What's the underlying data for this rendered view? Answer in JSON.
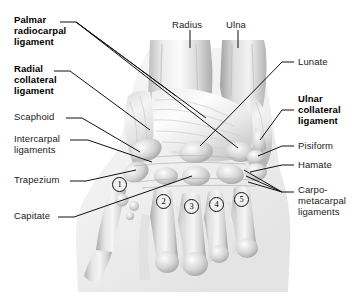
{
  "figure": {
    "type": "anatomical-illustration",
    "background_color": "#ffffff",
    "ink_color": "#1a1a1a",
    "width": 357,
    "height": 297
  },
  "labels_left": [
    {
      "id": "palmar-radiocarpal-ligament",
      "text": "Palmar\nradiocarpal\nligament",
      "bold": true,
      "x": 14,
      "y": 14
    },
    {
      "id": "radial-collateral-ligament",
      "text": "Radial\ncollateral\nligament",
      "bold": true,
      "x": 14,
      "y": 63
    },
    {
      "id": "scaphoid",
      "text": "Scaphoid",
      "bold": false,
      "x": 14,
      "y": 111
    },
    {
      "id": "intercarpal-ligaments",
      "text": "Intercarpal\nligaments",
      "bold": false,
      "x": 14,
      "y": 133
    },
    {
      "id": "trapezium",
      "text": "Trapezium",
      "bold": false,
      "x": 14,
      "y": 174
    },
    {
      "id": "capitate",
      "text": "Capitate",
      "bold": false,
      "x": 14,
      "y": 210
    }
  ],
  "labels_top": [
    {
      "id": "radius",
      "text": "Radius",
      "bold": false,
      "x": 172,
      "y": 19
    },
    {
      "id": "ulna",
      "text": "Ulna",
      "bold": false,
      "x": 226,
      "y": 19
    }
  ],
  "labels_right": [
    {
      "id": "lunate",
      "text": "Lunate",
      "bold": false,
      "x": 298,
      "y": 58
    },
    {
      "id": "ulnar-collateral-ligament",
      "text": "Ulnar\ncollateral\nligament",
      "bold": true,
      "x": 298,
      "y": 93
    },
    {
      "id": "pisiform",
      "text": "Pisiform",
      "bold": false,
      "x": 298,
      "y": 142
    },
    {
      "id": "hamate",
      "text": "Hamate",
      "bold": false,
      "x": 298,
      "y": 161
    },
    {
      "id": "carpometacarpal-ligaments",
      "text": "Carpo-\nmetacarpal\nligaments",
      "bold": false,
      "x": 298,
      "y": 184
    }
  ],
  "callout_numbers": [
    {
      "id": "metacarpal-1",
      "text": "1",
      "x": 112,
      "y": 177
    },
    {
      "id": "metacarpal-2",
      "text": "2",
      "x": 156,
      "y": 194
    },
    {
      "id": "metacarpal-3",
      "text": "3",
      "x": 184,
      "y": 199
    },
    {
      "id": "metacarpal-4",
      "text": "4",
      "x": 209,
      "y": 197
    },
    {
      "id": "metacarpal-5",
      "text": "5",
      "x": 234,
      "y": 192
    }
  ]
}
